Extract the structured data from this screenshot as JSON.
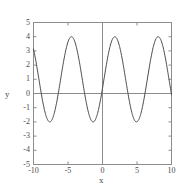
{
  "chart_data": {
    "type": "line",
    "title": "",
    "subtitle": "",
    "xlabel": "x",
    "ylabel": "y",
    "xlim": [
      -10,
      10
    ],
    "ylim": [
      -5,
      5
    ],
    "xticks": [
      -10,
      -5,
      0,
      5,
      10
    ],
    "yticks": [
      -5,
      -4,
      -3,
      -2,
      -1,
      0,
      1,
      2,
      3,
      4,
      5
    ],
    "xtick_labels": [
      "-10",
      "-5",
      "0",
      "5",
      "10"
    ],
    "ytick_labels": [
      "-5",
      "-4",
      "-3",
      "-2",
      "-1",
      "0",
      "1",
      "2",
      "3",
      "4",
      "5"
    ],
    "grid": false,
    "legend": null,
    "annotations": [],
    "series": [
      {
        "name": "y",
        "color": "#4a4a4a",
        "line_width": 1,
        "amplitude": 3,
        "offset": 1,
        "period": 6.283185307179586,
        "phase": -4.5,
        "description": "sinusoid oscillating between -2 and 4",
        "x": [
          -10.0,
          -9.6,
          -9.2,
          -8.8,
          -8.4,
          -8.0,
          -7.6,
          -7.2,
          -6.8,
          -6.4,
          -6.0,
          -5.6,
          -5.2,
          -4.8,
          -4.4,
          -4.0,
          -3.6,
          -3.2,
          -2.8,
          -2.4,
          -2.0,
          -1.6,
          -1.2,
          -0.8,
          -0.4,
          0.0,
          0.4,
          0.8,
          1.2,
          1.6,
          2.0,
          2.4,
          2.8,
          3.2,
          3.6,
          4.0,
          4.4,
          4.8,
          5.2,
          5.6,
          6.0,
          6.4,
          6.8,
          7.2,
          7.6,
          8.0,
          8.4,
          8.8,
          9.2,
          9.6,
          10.0
        ],
        "y": [
          2.72,
          1.39,
          0.07,
          -0.99,
          -1.71,
          -1.99,
          -1.81,
          -1.21,
          -0.31,
          0.71,
          1.71,
          2.53,
          3.12,
          3.48,
          3.54,
          3.31,
          2.81,
          2.07,
          1.15,
          0.15,
          -0.81,
          -1.57,
          -1.93,
          -1.95,
          -1.63,
          -1.0,
          -0.13,
          0.88,
          1.89,
          2.74,
          3.31,
          3.54,
          3.46,
          3.05,
          2.36,
          1.48,
          0.5,
          -0.47,
          -1.31,
          -1.81,
          -1.99,
          -1.84,
          -1.28,
          -0.41,
          0.59,
          1.6,
          2.46,
          3.08,
          3.47,
          3.54,
          -0.5
        ]
      }
    ],
    "styles": {
      "axis_color": "#8c8c8c",
      "frame_color": "#8c8c8c",
      "curve_color": "#4a4a4a",
      "background": "#ffffff",
      "text_color": "#4a4a4a"
    }
  }
}
